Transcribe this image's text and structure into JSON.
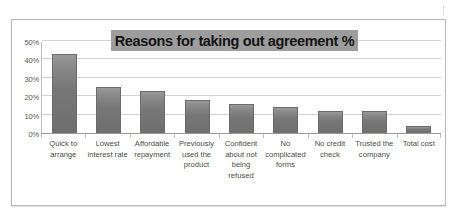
{
  "chart_data": {
    "type": "bar",
    "title": "Reasons for taking out agreement %",
    "xlabel": "",
    "ylabel": "",
    "ylim": [
      0,
      50
    ],
    "grid": true,
    "legend": "none",
    "ytick_labels": [
      "50%",
      "40%",
      "30%",
      "20%",
      "10%",
      "0%"
    ],
    "ytick_values": [
      50,
      40,
      30,
      20,
      10,
      0
    ],
    "categories": [
      "Quick to arrange",
      "Lowest interest rate",
      "Affordable repayment",
      "Previously used the product",
      "Confident about not being refused",
      "No complicated forms",
      "No credit check",
      "Trusted the company",
      "Total cost"
    ],
    "values": [
      43,
      25,
      23,
      18,
      16,
      14,
      12,
      12,
      4
    ],
    "series": [
      {
        "name": "Reasons for taking out agreement %",
        "values": [
          43,
          25,
          23,
          18,
          16,
          14,
          12,
          12,
          4
        ]
      }
    ],
    "colors": {
      "bar_fill": "#767676",
      "bar_border": "#6a6a6a",
      "title_banner": "#9d9d9d",
      "title_text": "#141414",
      "gridline": "#d2d2d2",
      "axis": "#9a9a9a",
      "frame_border": "#b9b9b9",
      "background": "#ffffff",
      "tick_text": "#555555",
      "category_text": "#4a4a4a"
    }
  }
}
